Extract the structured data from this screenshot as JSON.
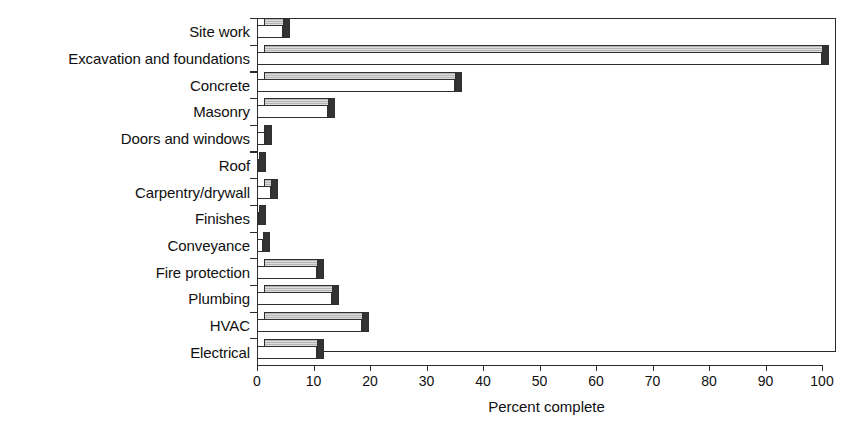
{
  "chart_data": {
    "type": "bar",
    "orientation": "horizontal",
    "title": "",
    "xlabel": "Percent complete",
    "ylabel": "",
    "xlim": [
      0,
      100
    ],
    "xticks": [
      0,
      10,
      20,
      30,
      40,
      50,
      60,
      70,
      80,
      90,
      100
    ],
    "grid": false,
    "legend": false,
    "style": "3d-bar",
    "colors": {
      "bar_front": "#ffffff",
      "bar_top": "#b4b4b4",
      "bar_cap": "#333333",
      "outline": "#2f2f2f",
      "background": "#ffffff",
      "text": "#101010"
    },
    "categories": [
      "Site work",
      "Excavation and foundations",
      "Concrete",
      "Masonry",
      "Doors and windows",
      "Roof",
      "Carpentry/drywall",
      "Finishes",
      "Conveyance",
      "Fire protection",
      "Plumbing",
      "HVAC",
      "Electrical"
    ],
    "values": [
      4.6,
      100,
      35.0,
      12.5,
      1.5,
      0,
      2.5,
      0,
      1.0,
      10.6,
      13.3,
      18.6,
      10.6
    ]
  }
}
